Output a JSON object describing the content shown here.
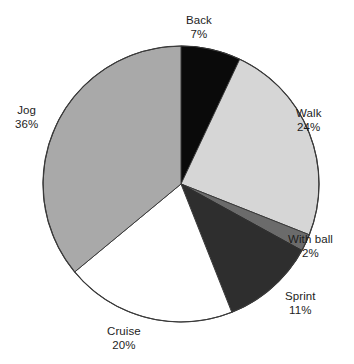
{
  "chart_data": {
    "type": "pie",
    "title": "",
    "subtitle": "",
    "xlabel": "",
    "ylabel": "",
    "legend_position": "none",
    "grid": false,
    "label_format": "name + percent",
    "start_angle_deg": 0,
    "direction": "clockwise",
    "categories": [
      "Back",
      "Walk",
      "With ball",
      "Sprint",
      "Cruise",
      "Jog"
    ],
    "values": [
      7,
      24,
      2,
      11,
      20,
      36
    ],
    "units": "%",
    "total": 100,
    "slices": [
      {
        "name": "Back",
        "value": 7,
        "value_text": "7%",
        "color": "#0a0a0a",
        "stroke": "#0a0a0a",
        "start_deg": 0,
        "end_deg": 25.2,
        "label_position": "top"
      },
      {
        "name": "Walk",
        "value": 24,
        "value_text": "24%",
        "color": "#d6d6d6",
        "stroke": "#3a3a3a",
        "start_deg": 25.2,
        "end_deg": 111.6,
        "label_position": "right"
      },
      {
        "name": "With ball",
        "value": 2,
        "value_text": "2%",
        "color": "#6b6b6b",
        "stroke": "#3a3a3a",
        "start_deg": 111.6,
        "end_deg": 118.8,
        "label_position": "right"
      },
      {
        "name": "Sprint",
        "value": 11,
        "value_text": "11%",
        "color": "#2e2e2e",
        "stroke": "#2e2e2e",
        "start_deg": 118.8,
        "end_deg": 158.4,
        "label_position": "bottom-right"
      },
      {
        "name": "Cruise",
        "value": 20,
        "value_text": "20%",
        "color": "#ffffff",
        "stroke": "#3a3a3a",
        "start_deg": 158.4,
        "end_deg": 230.4,
        "label_position": "bottom"
      },
      {
        "name": "Jog",
        "value": 36,
        "value_text": "36%",
        "color": "#a9a9a9",
        "stroke": "#3a3a3a",
        "start_deg": 230.4,
        "end_deg": 360,
        "label_position": "left"
      }
    ],
    "geometry": {
      "center_x": 181,
      "center_y": 184,
      "radius": 138
    },
    "colors": {
      "background": "#ffffff",
      "outline": "#3a3a3a",
      "text": "#1d1d1d"
    }
  }
}
